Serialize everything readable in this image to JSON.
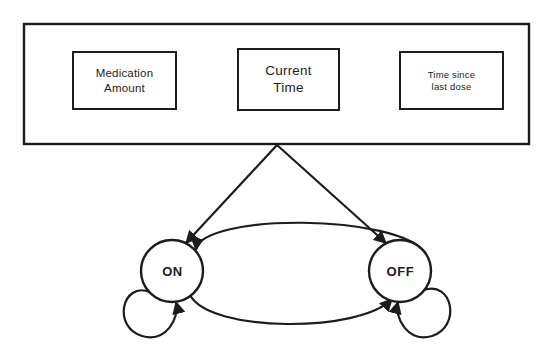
{
  "diagram": {
    "stroke_color": "#1c1c1c",
    "fill_color": "#ffffff",
    "container": {
      "name": "inputs-container",
      "x": 24,
      "y": 24,
      "width": 505,
      "height": 120
    },
    "input_boxes": [
      {
        "id": "medication-amount",
        "lines": [
          "Medication",
          "Amount"
        ],
        "x": 73,
        "y": 52,
        "width": 103,
        "height": 57
      },
      {
        "id": "current-time",
        "lines": [
          "Current",
          "Time"
        ],
        "x": 238,
        "y": 49,
        "width": 101,
        "height": 61
      },
      {
        "id": "time-since-last-dose",
        "lines": [
          "Time since",
          "last dose"
        ],
        "x": 400,
        "y": 52,
        "width": 103,
        "height": 57
      }
    ],
    "states": [
      {
        "id": "on",
        "label": "ON",
        "cx": 172,
        "cy": 271,
        "r": 31
      },
      {
        "id": "off",
        "label": "OFF",
        "cx": 400,
        "cy": 271,
        "r": 31
      }
    ],
    "connectors": [
      {
        "id": "inputs-to-on",
        "from": "inputs-container",
        "to": "on",
        "kind": "line",
        "arrow": true
      },
      {
        "id": "inputs-to-off",
        "from": "inputs-container",
        "to": "off",
        "kind": "line",
        "arrow": true
      },
      {
        "id": "off-to-on",
        "from": "off",
        "to": "on",
        "kind": "arc-top",
        "arrow": true
      },
      {
        "id": "on-to-off",
        "from": "on",
        "to": "off",
        "kind": "arc-bottom",
        "arrow": true
      },
      {
        "id": "on-self-loop",
        "from": "on",
        "to": "on",
        "kind": "self-loop",
        "arrow": true
      },
      {
        "id": "off-self-loop",
        "from": "off",
        "to": "off",
        "kind": "self-loop",
        "arrow": true
      }
    ],
    "fan_apex": {
      "x": 277,
      "y": 144
    }
  }
}
